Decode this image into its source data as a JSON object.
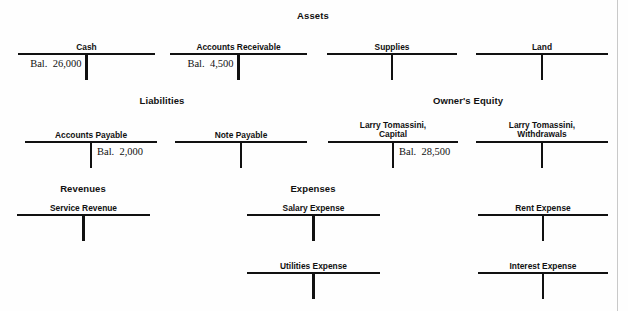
{
  "page": {
    "width": 628,
    "height": 311,
    "background": "#fefefe",
    "ink_color": "#111111",
    "scan_edge_color": "#c9c9c9"
  },
  "sections": [
    {
      "id": "assets",
      "label": "Assets",
      "x": 313,
      "y": 10
    },
    {
      "id": "liabilities",
      "label": "Liabilities",
      "x": 162,
      "y": 95
    },
    {
      "id": "owners-equity",
      "label": "Owner's Equity",
      "x": 468,
      "y": 95
    },
    {
      "id": "revenues",
      "label": "Revenues",
      "x": 83,
      "y": 183
    },
    {
      "id": "expenses",
      "label": "Expenses",
      "x": 313,
      "y": 183
    }
  ],
  "accounts": [
    {
      "id": "cash",
      "section": "assets",
      "title": [
        "Cash"
      ],
      "bar_left": 18,
      "bar_right": 155,
      "bar_top": 53,
      "stem_height": 25,
      "entries": [
        {
          "side": "debit",
          "label": "Bal.",
          "amount": "26,000"
        }
      ]
    },
    {
      "id": "accounts-receivable",
      "section": "assets",
      "title": [
        "Accounts Receivable"
      ],
      "bar_left": 170,
      "bar_right": 307,
      "bar_top": 53,
      "stem_height": 25,
      "entries": [
        {
          "side": "debit",
          "label": "Bal.",
          "amount": "4,500"
        }
      ]
    },
    {
      "id": "supplies",
      "section": "assets",
      "title": [
        "Supplies"
      ],
      "bar_left": 327,
      "bar_right": 457,
      "bar_top": 53,
      "stem_height": 25,
      "entries": []
    },
    {
      "id": "land",
      "section": "assets",
      "title": [
        "Land"
      ],
      "bar_left": 476,
      "bar_right": 608,
      "bar_top": 53,
      "stem_height": 25,
      "entries": []
    },
    {
      "id": "accounts-payable",
      "section": "liabilities",
      "title": [
        "Accounts Payable"
      ],
      "bar_left": 25,
      "bar_right": 157,
      "bar_top": 141,
      "stem_height": 25,
      "entries": [
        {
          "side": "credit",
          "label": "Bal.",
          "amount": "2,000"
        }
      ]
    },
    {
      "id": "note-payable",
      "section": "liabilities",
      "title": [
        "Note Payable"
      ],
      "bar_left": 175,
      "bar_right": 307,
      "bar_top": 141,
      "stem_height": 25,
      "entries": []
    },
    {
      "id": "larry-tomassini-capital",
      "section": "owners-equity",
      "title": [
        "Larry Tomassini,",
        "Capital"
      ],
      "bar_left": 328,
      "bar_right": 458,
      "bar_top": 141,
      "stem_height": 25,
      "entries": [
        {
          "side": "credit",
          "label": "Bal.",
          "amount": "28,500"
        }
      ]
    },
    {
      "id": "larry-tomassini-withdrawals",
      "section": "owners-equity",
      "title": [
        "Larry Tomassini,",
        "Withdrawals"
      ],
      "bar_left": 476,
      "bar_right": 608,
      "bar_top": 141,
      "stem_height": 25,
      "entries": []
    },
    {
      "id": "service-revenue",
      "section": "revenues",
      "title": [
        "Service Revenue"
      ],
      "bar_left": 17,
      "bar_right": 150,
      "bar_top": 214,
      "stem_height": 25,
      "entries": []
    },
    {
      "id": "salary-expense",
      "section": "expenses",
      "title": [
        "Salary Expense"
      ],
      "bar_left": 247,
      "bar_right": 380,
      "bar_top": 214,
      "stem_height": 25,
      "entries": []
    },
    {
      "id": "rent-expense",
      "section": "expenses",
      "title": [
        "Rent Expense"
      ],
      "bar_left": 478,
      "bar_right": 608,
      "bar_top": 214,
      "stem_height": 25,
      "entries": []
    },
    {
      "id": "utilities-expense",
      "section": "expenses",
      "title": [
        "Utilities Expense"
      ],
      "bar_left": 247,
      "bar_right": 380,
      "bar_top": 272,
      "stem_height": 25,
      "entries": []
    },
    {
      "id": "interest-expense",
      "section": "expenses",
      "title": [
        "Interest Expense"
      ],
      "bar_left": 478,
      "bar_right": 608,
      "bar_top": 272,
      "stem_height": 25,
      "entries": []
    }
  ],
  "scan_edge": {
    "x": 617
  }
}
